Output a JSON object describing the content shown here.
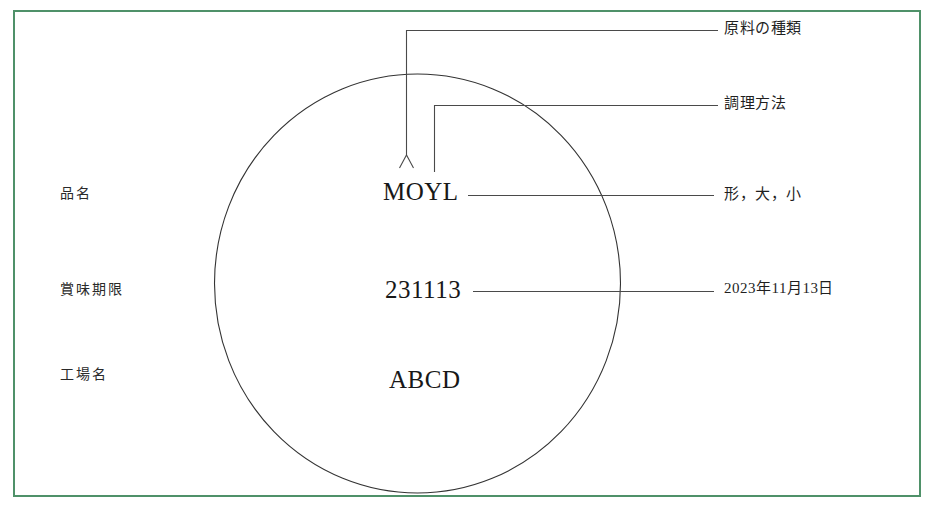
{
  "diagram": {
    "frame_color": "#4f9169",
    "line_color": "#333333",
    "stamp": {
      "shape": "circle",
      "lines": [
        {
          "id": "product_code",
          "value": "MOYL"
        },
        {
          "id": "best_before_code",
          "value": "231113"
        },
        {
          "id": "factory_code",
          "value": "ABCD"
        }
      ]
    },
    "left_labels": [
      {
        "id": "product_name",
        "text": "品名"
      },
      {
        "id": "best_before",
        "text": "賞味期限"
      },
      {
        "id": "factory_name",
        "text": "工場名"
      }
    ],
    "right_labels": [
      {
        "id": "ingredient_type",
        "text": "原料の種類"
      },
      {
        "id": "cooking_method",
        "text": "調理方法"
      },
      {
        "id": "shape_size",
        "text": "形，大，小"
      },
      {
        "id": "best_before_date",
        "text": "2023年11月13日"
      }
    ]
  }
}
